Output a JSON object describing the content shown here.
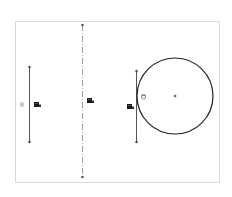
{
  "sketch": {
    "colors": {
      "background": "#ffffff",
      "border": "#d9d9d9",
      "geometry": "#555555",
      "circle": "#222222",
      "construction": "#888888",
      "endpoint": "#444444",
      "relation_icon": "#1a1a1a",
      "parallel_icon": "#999999"
    },
    "frame": {
      "x": 15,
      "y": 21,
      "width": 204,
      "height": 161
    },
    "lines": [
      {
        "name": "left-vertical-line",
        "x1": 29,
        "y1": 67,
        "x2": 29,
        "y2": 142
      },
      {
        "name": "right-vertical-line",
        "x1": 136,
        "y1": 71,
        "x2": 136,
        "y2": 142
      }
    ],
    "centerline": {
      "x1": 82,
      "y1": 25,
      "x2": 82,
      "y2": 177
    },
    "circle": {
      "cx": 175,
      "cy": 96,
      "r": 38
    },
    "relations": [
      {
        "name": "parallel-relation-icon",
        "glyph": "||",
        "x": 20,
        "y": 102
      },
      {
        "name": "vertical-relation-icon-left",
        "x": 34,
        "y": 102
      },
      {
        "name": "vertical-relation-icon-center",
        "x": 87,
        "y": 98
      },
      {
        "name": "vertical-relation-icon-right",
        "x": 127,
        "y": 104
      },
      {
        "name": "tangent-relation-icon",
        "x": 141,
        "y": 94
      }
    ]
  }
}
